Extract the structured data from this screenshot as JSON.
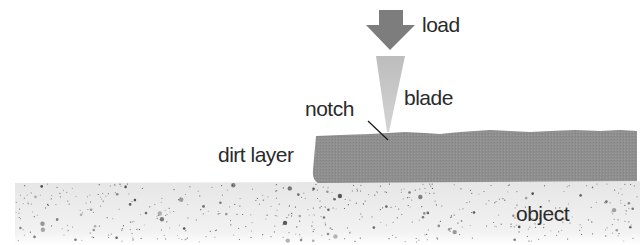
{
  "diagram": {
    "labels": {
      "load": "load",
      "blade": "blade",
      "notch": "notch",
      "dirt_layer": "dirt layer",
      "object": "object"
    },
    "colors": {
      "arrow": "#7d7d7d",
      "blade": "#c4c4c4",
      "dirt_layer": "#8f8f8f",
      "object": "#ededed",
      "speckle": "#3a3a3a",
      "text": "#2a2a2a",
      "leader_line": "#1a1a1a"
    },
    "parts": [
      "load-arrow",
      "blade",
      "notch",
      "dirt-layer",
      "object"
    ]
  }
}
